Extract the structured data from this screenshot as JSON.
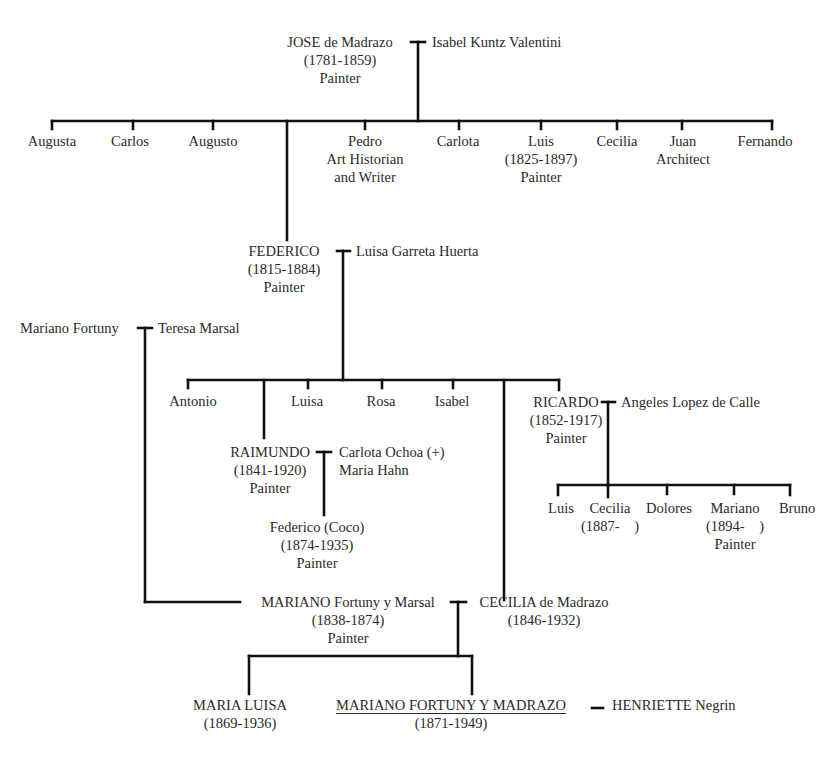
{
  "diagram": {
    "type": "family-tree",
    "generation_1": {
      "jose": {
        "name": "JOSE de Madrazo",
        "dates": "(1781-1859)",
        "role": "Painter"
      },
      "spouse": {
        "name": "Isabel Kuntz Valentini"
      }
    },
    "generation_2": {
      "children": [
        {
          "name": "Augusta"
        },
        {
          "name": "Carlos"
        },
        {
          "name": "Augusto"
        },
        {
          "name": "Pedro",
          "line2": "Art Historian",
          "line3": "and Writer"
        },
        {
          "name": "Carlota"
        },
        {
          "name": "Luis",
          "line2": "(1825-1897)",
          "line3": "Painter"
        },
        {
          "name": "Cecilia"
        },
        {
          "name": "Juan",
          "line2": "Architect"
        },
        {
          "name": "Fernando"
        }
      ],
      "federico": {
        "name": "FEDERICO",
        "dates": "(1815-1884)",
        "role": "Painter"
      },
      "federico_spouse": {
        "name": "Luisa Garreta Huerta"
      }
    },
    "fortuny_parents": {
      "father": {
        "name": "Mariano Fortuny"
      },
      "mother": {
        "name": "Teresa Marsal"
      }
    },
    "generation_3": {
      "children": [
        {
          "name": "Antonio"
        },
        {
          "name": "Luisa"
        },
        {
          "name": "Rosa"
        },
        {
          "name": "Isabel"
        }
      ],
      "raimundo": {
        "name": "RAIMUNDO",
        "dates": "(1841-1920)",
        "role": "Painter"
      },
      "raimundo_spouses": {
        "line1": "Carlota Ochoa (+)",
        "line2": "Maria Hahn"
      },
      "ricardo": {
        "name": "RICARDO",
        "dates": "(1852-1917)",
        "role": "Painter"
      },
      "ricardo_spouse": {
        "name": "Angeles Lopez de Calle"
      }
    },
    "generation_4": {
      "federico_coco": {
        "name": "Federico (Coco)",
        "dates": "(1874-1935)",
        "role": "Painter"
      },
      "ricardo_children": [
        {
          "name": "Luis"
        },
        {
          "name": "Cecilia",
          "line2": "(1887-    )"
        },
        {
          "name": "Dolores"
        },
        {
          "name": "Mariano",
          "line2": "(1894-    )",
          "line3": "Painter"
        },
        {
          "name": "Bruno"
        }
      ],
      "mariano_fortuny": {
        "name": "MARIANO Fortuny y Marsal",
        "dates": "(1838-1874)",
        "role": "Painter"
      },
      "cecilia_madrazo": {
        "name": "CECILIA de Madrazo",
        "dates": "(1846-1932)"
      }
    },
    "generation_5": {
      "maria_luisa": {
        "name": "MARIA LUISA",
        "dates": "(1869-1936)"
      },
      "mariano_fym": {
        "name": "MARIANO FORTUNY Y MADRAZO",
        "dates": "(1871-1949)"
      },
      "henriette": {
        "name": "HENRIETTE Negrin"
      }
    }
  }
}
